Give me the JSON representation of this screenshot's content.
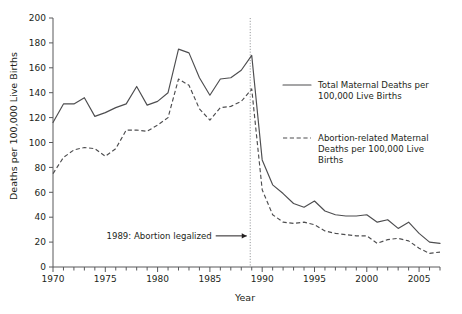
{
  "chart_data": {
    "type": "line",
    "title": "",
    "xlabel": "Year",
    "ylabel": "Deaths per 100,000 Live Births",
    "xlim": [
      1970,
      2007
    ],
    "ylim": [
      0,
      200
    ],
    "ytick_step": 20,
    "xtick_step": 1,
    "xtick_label_step": 5,
    "grid": false,
    "legend_position": "right-inside",
    "x": [
      1970,
      1971,
      1972,
      1973,
      1974,
      1975,
      1976,
      1977,
      1978,
      1979,
      1980,
      1981,
      1982,
      1983,
      1984,
      1985,
      1986,
      1987,
      1988,
      1989,
      1990,
      1991,
      1992,
      1993,
      1994,
      1995,
      1996,
      1997,
      1998,
      1999,
      2000,
      2001,
      2002,
      2003,
      2004,
      2005,
      2006,
      2007
    ],
    "series": [
      {
        "name": "Total Maternal Deaths per 100,000 Live Births",
        "style": "solid",
        "values": [
          116,
          131,
          131,
          136,
          121,
          124,
          128,
          131,
          145,
          130,
          133,
          140,
          175,
          172,
          152,
          138,
          151,
          152,
          158,
          170,
          86,
          66,
          59,
          51,
          48,
          53,
          45,
          42,
          41,
          41,
          42,
          36,
          38,
          31,
          36,
          27,
          20,
          19
        ]
      },
      {
        "name": "Abortion-related Maternal Deaths per 100,000 Live Births",
        "style": "dashed",
        "values": [
          75,
          88,
          94,
          96,
          95,
          89,
          95,
          110,
          110,
          109,
          114,
          120,
          151,
          146,
          127,
          118,
          128,
          129,
          133,
          143,
          62,
          42,
          36,
          35,
          36,
          34,
          29,
          27,
          26,
          25,
          25,
          19,
          22,
          23,
          21,
          15,
          11,
          12
        ]
      }
    ],
    "yticks": [
      0,
      20,
      40,
      60,
      80,
      100,
      120,
      140,
      160,
      180,
      200
    ],
    "xticks_labeled": [
      1970,
      1975,
      1980,
      1985,
      1990,
      1995,
      2000,
      2005
    ],
    "annotations": [
      {
        "text": "1989: Abortion legalized",
        "x": 1989,
        "y": 25,
        "type": "arrow-right-to-vline"
      }
    ],
    "event_line": {
      "x": 1989,
      "label": "1989: Abortion legalized"
    },
    "colors": {
      "line": "#4d4d4f",
      "axis": "#58595b",
      "event_line": "#939598",
      "text": "#231f20"
    }
  },
  "legend": {
    "items": [
      {
        "style": "solid",
        "line1": "Total Maternal Deaths per",
        "line2": "100,000 Live Births",
        "line3": ""
      },
      {
        "style": "dashed",
        "line1": "Abortion-related Maternal",
        "line2": "Deaths per 100,000 Live",
        "line3": "Births"
      }
    ]
  },
  "axes": {
    "ylabel": "Deaths per 100,000 Live Births",
    "xlabel": "Year",
    "ytick_labels": [
      "0",
      "20",
      "40",
      "60",
      "80",
      "100",
      "120",
      "140",
      "160",
      "180",
      "200"
    ],
    "xtick_labels": [
      "1970",
      "1975",
      "1980",
      "1985",
      "1990",
      "1995",
      "2000",
      "2005"
    ]
  },
  "annotation": {
    "text": "1989: Abortion legalized"
  }
}
